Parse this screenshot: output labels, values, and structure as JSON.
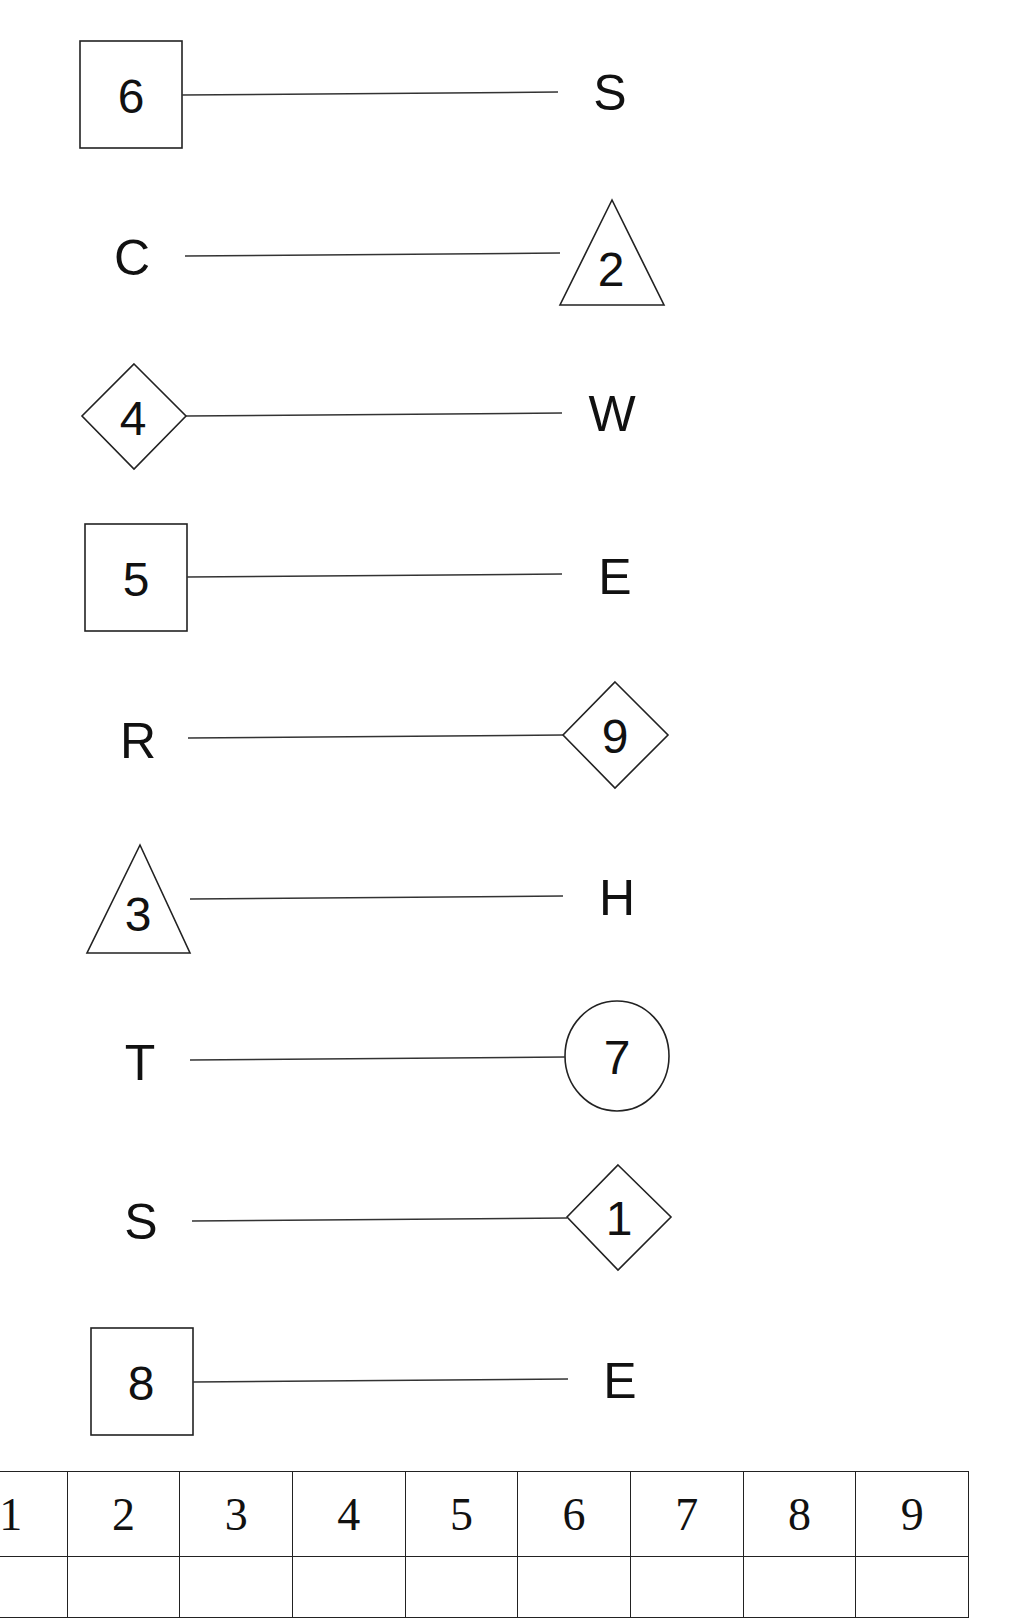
{
  "worksheet": {
    "rows": [
      {
        "left": {
          "kind": "shape",
          "shape": "square",
          "value": "6"
        },
        "right": {
          "kind": "letter",
          "value": "S"
        }
      },
      {
        "left": {
          "kind": "letter",
          "value": "C"
        },
        "right": {
          "kind": "shape",
          "shape": "triangle",
          "value": "2"
        }
      },
      {
        "left": {
          "kind": "shape",
          "shape": "diamond",
          "value": "4"
        },
        "right": {
          "kind": "letter",
          "value": "W"
        }
      },
      {
        "left": {
          "kind": "shape",
          "shape": "square",
          "value": "5"
        },
        "right": {
          "kind": "letter",
          "value": "E"
        }
      },
      {
        "left": {
          "kind": "letter",
          "value": "R"
        },
        "right": {
          "kind": "shape",
          "shape": "diamond",
          "value": "9"
        }
      },
      {
        "left": {
          "kind": "shape",
          "shape": "triangle",
          "value": "3"
        },
        "right": {
          "kind": "letter",
          "value": "H"
        }
      },
      {
        "left": {
          "kind": "letter",
          "value": "T"
        },
        "right": {
          "kind": "shape",
          "shape": "circle",
          "value": "7"
        }
      },
      {
        "left": {
          "kind": "letter",
          "value": "S"
        },
        "right": {
          "kind": "shape",
          "shape": "diamond",
          "value": "1"
        }
      },
      {
        "left": {
          "kind": "shape",
          "shape": "square",
          "value": "8"
        },
        "right": {
          "kind": "letter",
          "value": "E"
        }
      }
    ]
  },
  "answer_table": {
    "headers": [
      "1",
      "2",
      "3",
      "4",
      "5",
      "6",
      "7",
      "8",
      "9"
    ],
    "answers": [
      "",
      "",
      "",
      "",
      "",
      "",
      "",
      "",
      ""
    ]
  },
  "colors": {
    "ink": "#111111",
    "line": "#333333",
    "background": "#ffffff"
  }
}
